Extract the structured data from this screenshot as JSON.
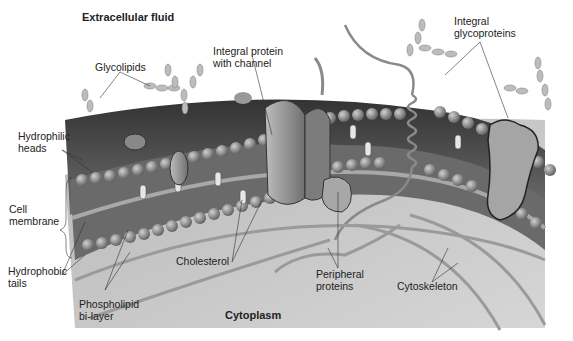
{
  "diagram": {
    "title_top": "Extracellular fluid",
    "title_bottom": "Cytoplasm",
    "labels": {
      "glycolipids": "Glycolipids",
      "integral_channel": "Integral protein\nwith channel",
      "integral_glyco": "Integral\nglycoproteins",
      "hydrophilic": "Hydrophilic\nheads",
      "cell_membrane": "Cell\nmembrane",
      "hydrophobic": "Hydrophobic\ntails",
      "phospholipid": "Phospholipid\nbi-layer",
      "cholesterol": "Cholesterol",
      "peripheral": "Peripheral\nproteins",
      "cytoskeleton": "Cytoskeleton"
    },
    "colors": {
      "membrane_dark": "#4a4a4a",
      "membrane_mid": "#7a7a7a",
      "cytoplasm": "#c9c9c9",
      "head": "#8f8f8f",
      "protein": "#9a9a9a",
      "sugar": "#b5b5b5"
    }
  }
}
